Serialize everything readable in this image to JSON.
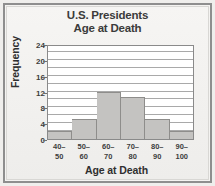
{
  "figure": {
    "title_line1": "U.S. Presidents",
    "title_line2": "Age at Death",
    "frame_color": "#8e8e8e",
    "background_color": "#f4f3f1",
    "bar_fill_color": "#c4c3c1",
    "bar_edge_color": "#8e8d8b",
    "gridline_color": "#a9a9a9",
    "text_color": "#3d3d3d"
  },
  "chart_data": {
    "type": "bar",
    "title": "U.S. Presidents Age at Death",
    "xlabel": "Age at Death",
    "ylabel": "Frequency",
    "categories": [
      "40–50",
      "50–60",
      "60–70",
      "70–80",
      "80–90",
      "90–100"
    ],
    "category_lines": [
      [
        "40–",
        "50"
      ],
      [
        "50–",
        "60"
      ],
      [
        "60–",
        "70"
      ],
      [
        "70–",
        "80"
      ],
      [
        "80–",
        "90"
      ],
      [
        "90–",
        "100"
      ]
    ],
    "values": [
      2,
      5,
      12,
      10.5,
      5,
      2
    ],
    "ylim": [
      0,
      24
    ],
    "ytick_labels": [
      "0",
      "4",
      "8",
      "12",
      "16",
      "20",
      "24"
    ],
    "ytick_values": [
      0,
      4,
      8,
      12,
      16,
      20,
      24
    ],
    "gridline_interval": 2,
    "grid": true,
    "legend": "none",
    "histogram": true
  }
}
